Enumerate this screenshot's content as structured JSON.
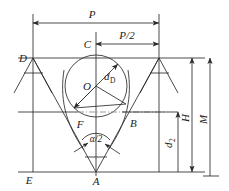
{
  "diagram": {
    "stroke_color": "#2b2b2b",
    "background_color": "#ffffff",
    "points": {
      "A": "A",
      "B": "B",
      "C": "C",
      "D": "D",
      "E": "E",
      "F": "F",
      "O": "O"
    },
    "dimensions": {
      "pitch": "P",
      "half_pitch": "P/2",
      "ball_diameter_main": "d",
      "ball_diameter_sub": "D",
      "height_H": "H",
      "measure_M": "M",
      "minor_diameter_main": "d",
      "minor_diameter_sub": "2",
      "half_angle": "α/2"
    }
  }
}
